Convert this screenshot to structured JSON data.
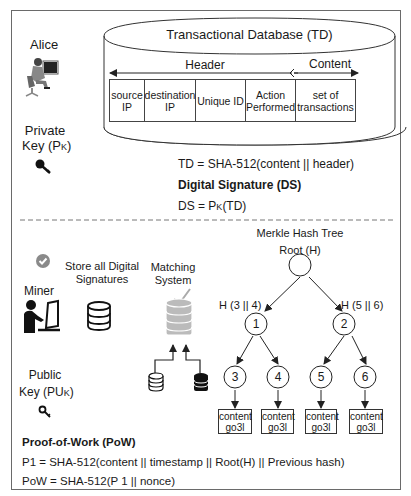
{
  "top_section": {
    "alice": {
      "label": "Alice",
      "icon": "person-at-computer-icon",
      "private_key_line1": "Private",
      "private_key_line2": "Key (P",
      "private_key_sub": "K",
      "private_key_close": ")",
      "key_icon": "key-icon"
    },
    "database": {
      "title": "Transactional Database (TD)",
      "header_label": "Header",
      "content_label": "Content",
      "fields": [
        {
          "line1": "source",
          "line2": "IP"
        },
        {
          "line1": "destination",
          "line2": "IP"
        },
        {
          "line1": "Unique ID",
          "line2": ""
        },
        {
          "line1": "Action",
          "line2": "Performed"
        },
        {
          "line1": "set of",
          "line2": "transactions"
        }
      ]
    },
    "formulas": {
      "td": "TD = SHA-512(content || header)",
      "ds_title": "Digital Signature (DS)",
      "ds_prefix": "DS = P",
      "ds_sub": "K",
      "ds_suffix": "(TD)"
    }
  },
  "bottom_section": {
    "miner": {
      "check_icon": "check-badge-icon",
      "label": "Miner",
      "icon": "person-at-laptop-icon",
      "public_key_line1": "Public",
      "public_key_line2": "Key (PU",
      "public_key_sub": "K",
      "public_key_close": ")",
      "key_icon": "key-outline-icon"
    },
    "store": {
      "line1": "Store all Digital",
      "line2": "Signatures",
      "icon": "database-icon"
    },
    "matching": {
      "line1": "Matching",
      "line2": "System",
      "icon": "database-check-icon"
    },
    "merkle": {
      "title": "Merkle Hash Tree",
      "root_label": "Root (H)",
      "left_hash": "H (3 || 4)",
      "right_hash": "H (5 || 6)",
      "nodes": [
        "1",
        "2",
        "3",
        "4",
        "5",
        "6"
      ],
      "leaves": [
        {
          "line1": "content",
          "line2": "go3l"
        },
        {
          "line1": "content",
          "line2": "go3l"
        },
        {
          "line1": "content",
          "line2": "go3l"
        },
        {
          "line1": "content",
          "line2": "go3l"
        }
      ]
    },
    "pow": {
      "title": "Proof-of-Work (PoW)",
      "p1": "P1 = SHA-512(content || timestamp || Root(H) || Previous hash)",
      "pow": "PoW = SHA-512(P 1 || nonce)"
    }
  },
  "colors": {
    "frame": "#6a6a6a",
    "line": "#222222",
    "check_gray": "#8a8a8a",
    "db_gray": "#b0b0b0"
  }
}
